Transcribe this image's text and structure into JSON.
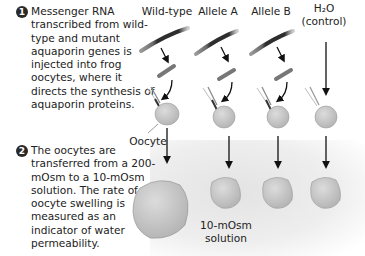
{
  "steps": [
    {
      "number": "1",
      "text": "Messenger RNA transcribed from wild-type and mutant aquaporin genes is injected into frog oocytes, where it directs the synthesis of aquaporin proteins."
    },
    {
      "number": "2",
      "text": "The oocytes are transferred from a 200-mOsm to a 10-mOsm solution. The rate of oocyte swelling is measured as an indicator of water permeability."
    }
  ],
  "columns": [
    {
      "label": "Wild-type",
      "result": "large-swelling"
    },
    {
      "label": "Allele A",
      "result": "small-swelling"
    },
    {
      "label": "Allele B",
      "result": "small-swelling"
    },
    {
      "label": "H₂O",
      "sublabel": "(control)",
      "result": "small-swelling"
    }
  ],
  "labels": {
    "oocyte": "Oocyte",
    "solution_line1": "10-mOsm",
    "solution_line2": "solution"
  },
  "colors": {
    "oocyte_fill": "#c9c9c9",
    "oocyte_stroke": "#9a9a9a",
    "mrna_dark": "#3a3a3a",
    "mrna_mid": "#7a7a7a",
    "arrow": "#111111",
    "background_band": "#e8e8e8"
  }
}
